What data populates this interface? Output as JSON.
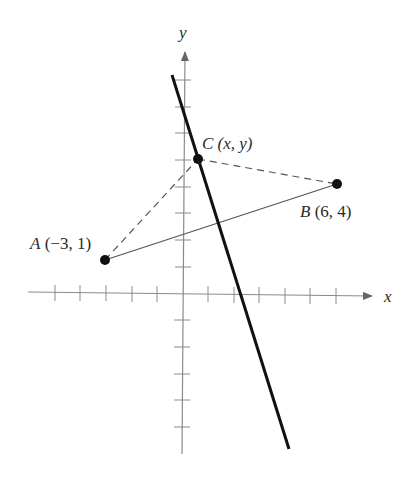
{
  "diagram": {
    "type": "coordinate-plane",
    "axes": {
      "x_label": "x",
      "y_label": "y",
      "x_ticks": [
        -6,
        -5,
        -4,
        -3,
        -2,
        -1,
        1,
        2,
        3,
        4,
        5,
        6
      ],
      "y_ticks": [
        -6,
        -5,
        -4,
        -3,
        -2,
        -1,
        1,
        2,
        3,
        4,
        5,
        6,
        7,
        8
      ],
      "axis_color": "#8a8a8a"
    },
    "points": [
      {
        "id": "A",
        "name": "A",
        "coords": "(−3, 1)",
        "x": -3,
        "y": 1
      },
      {
        "id": "B",
        "name": "B",
        "coords": "(6, 4)",
        "x": 6,
        "y": 4
      },
      {
        "id": "C",
        "name": "C",
        "coords": "(x, y)",
        "x": 0.6,
        "y": 5.2
      }
    ],
    "segments": [
      {
        "from": "A",
        "to": "B",
        "style": "solid-thin"
      },
      {
        "from": "A",
        "to": "C",
        "style": "dashed"
      },
      {
        "from": "C",
        "to": "B",
        "style": "dashed"
      }
    ],
    "perpendicular_bisector": {
      "style": "solid-thick",
      "color": "#111111"
    },
    "labels": {
      "A_name": "A",
      "A_coords": "(−3, 1)",
      "B_name": "B",
      "B_coords": "(6, 4)",
      "C_name": "C",
      "C_coords": "(x, y)"
    }
  }
}
